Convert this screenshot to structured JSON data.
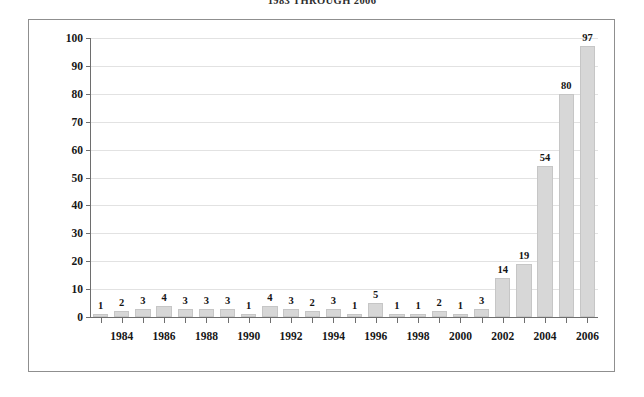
{
  "report": {
    "title": "1983 THROUGH 2006"
  },
  "colors": {
    "bar_fill": "#d7d7d7",
    "bar_edge": "#c6c6c6",
    "axis": "#6e6e6e",
    "gridline": "#e2e2e2",
    "frame": "#8f8f8f",
    "text": "#171717",
    "background": "#ffffff"
  },
  "chart_data": {
    "type": "bar",
    "title": "1983 THROUGH 2006",
    "xlabel": "",
    "ylabel": "",
    "ylim": [
      0,
      100
    ],
    "ytick_step": 10,
    "yticks": [
      0,
      10,
      20,
      30,
      40,
      50,
      60,
      70,
      80,
      90,
      100
    ],
    "grid": true,
    "legend": false,
    "data_labels": true,
    "categories": [
      "1983",
      "1984",
      "1985",
      "1986",
      "1987",
      "1988",
      "1989",
      "1990",
      "1991",
      "1992",
      "1993",
      "1994",
      "1995",
      "1996",
      "1997",
      "1998",
      "1999",
      "2000",
      "2001",
      "2002",
      "2003",
      "2004",
      "2005",
      "2006"
    ],
    "xtick_labels_shown": [
      "1984",
      "1986",
      "1988",
      "1990",
      "1992",
      "1994",
      "1996",
      "1998",
      "2000",
      "2002",
      "2004",
      "2006"
    ],
    "values": [
      1,
      2,
      3,
      4,
      3,
      3,
      3,
      1,
      4,
      3,
      2,
      3,
      1,
      5,
      1,
      1,
      2,
      1,
      3,
      14,
      19,
      54,
      80,
      97
    ]
  }
}
